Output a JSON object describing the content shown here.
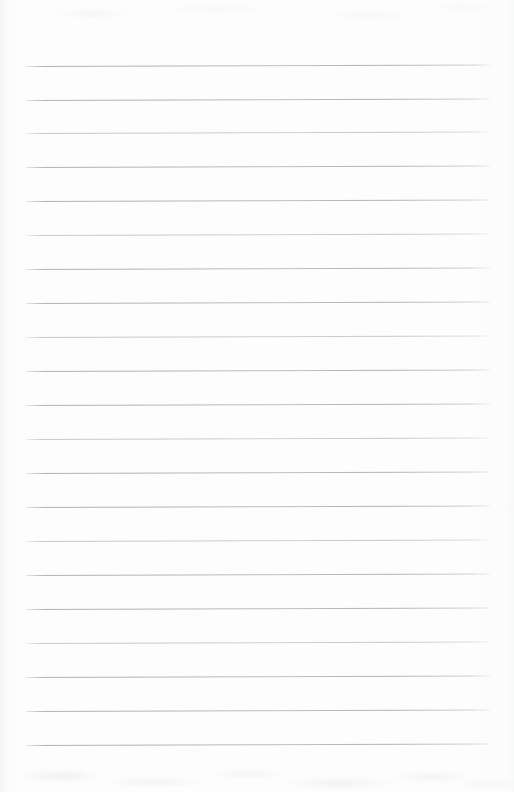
{
  "document": {
    "type": "scanned-ruled-paper",
    "title": "Blank Lined Paper",
    "content_text": "",
    "page_width": 514,
    "page_height": 792,
    "background_color": "#fdfdfd",
    "has_handwriting": false,
    "has_printed_text": false,
    "is_blank": true
  },
  "ruling": {
    "line_color": "#b0b5ba",
    "line_thickness_px": 1,
    "line_count": 21,
    "line_left_x": 26,
    "line_right_x": 490,
    "line_length_px": 464,
    "first_line_y": 66,
    "line_spacing_px": 33.9,
    "skew_degrees": -0.18,
    "margin_top_px": 66,
    "margin_bottom_px": 47,
    "margin_left_px": 26,
    "margin_right_px": 24,
    "lines": [
      {
        "index": 1,
        "y": 66,
        "weight": "heavy"
      },
      {
        "index": 2,
        "y": 100,
        "weight": "heavy"
      },
      {
        "index": 3,
        "y": 133,
        "weight": "light"
      },
      {
        "index": 4,
        "y": 167,
        "weight": "heavy"
      },
      {
        "index": 5,
        "y": 201,
        "weight": "heavy"
      },
      {
        "index": 6,
        "y": 235,
        "weight": "light"
      },
      {
        "index": 7,
        "y": 269,
        "weight": "heavy"
      },
      {
        "index": 8,
        "y": 303,
        "weight": "heavy"
      },
      {
        "index": 9,
        "y": 337,
        "weight": "light"
      },
      {
        "index": 10,
        "y": 371,
        "weight": "heavy"
      },
      {
        "index": 11,
        "y": 405,
        "weight": "heavy"
      },
      {
        "index": 12,
        "y": 439,
        "weight": "light"
      },
      {
        "index": 13,
        "y": 473,
        "weight": "heavy"
      },
      {
        "index": 14,
        "y": 507,
        "weight": "heavy"
      },
      {
        "index": 15,
        "y": 541,
        "weight": "light"
      },
      {
        "index": 16,
        "y": 575,
        "weight": "heavy"
      },
      {
        "index": 17,
        "y": 609,
        "weight": "heavy"
      },
      {
        "index": 18,
        "y": 643,
        "weight": "light"
      },
      {
        "index": 19,
        "y": 677,
        "weight": "heavy"
      },
      {
        "index": 20,
        "y": 711,
        "weight": "heavy"
      },
      {
        "index": 21,
        "y": 745,
        "weight": "heavy"
      }
    ]
  },
  "scan_artifacts": {
    "left_edge_shading": true,
    "right_edge_shading": true,
    "bottom_texture": true,
    "top_texture": true
  }
}
